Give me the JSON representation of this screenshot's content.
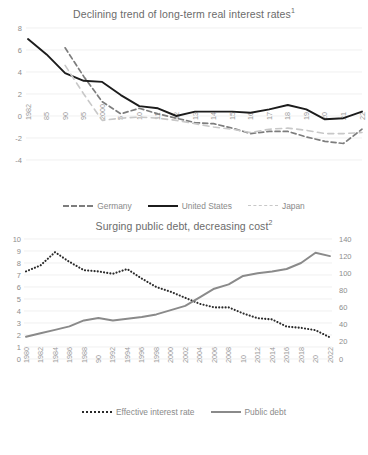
{
  "chart_data": [
    {
      "type": "line",
      "title": "Declining trend of long-term real interest rates",
      "title_superscript": "1",
      "xlabel": "",
      "ylabel": "",
      "ylim": [
        -4,
        8
      ],
      "yticks": [
        8,
        6,
        4,
        2,
        0,
        -2,
        -4
      ],
      "grid": true,
      "legend_position": "bottom",
      "x": [
        1982,
        1985,
        1990,
        1995,
        2000,
        2005,
        2010,
        2011,
        2012,
        2013,
        2014,
        2015,
        2016,
        2017,
        2018,
        2019,
        2020,
        2021,
        2022
      ],
      "tick_labels": [
        "1982",
        "85",
        "90",
        "95",
        "2000",
        "5",
        "10",
        "11",
        "12",
        "13",
        "14",
        "15",
        "16",
        "17",
        "18",
        "19",
        "20",
        "21",
        "22"
      ],
      "series": [
        {
          "name": "Germany",
          "style": "dashed-dark",
          "color": "#7d7d7d",
          "values": [
            null,
            null,
            6.2,
            3.6,
            1.3,
            0.2,
            0.7,
            0.2,
            -0.2,
            -0.6,
            -0.7,
            -1.1,
            -1.6,
            -1.4,
            -1.4,
            -1.9,
            -2.3,
            -2.5,
            -1.2
          ]
        },
        {
          "name": "United States",
          "style": "solid-black",
          "color": "#1c1c1c",
          "values": [
            7.0,
            5.6,
            3.9,
            3.2,
            3.1,
            1.9,
            0.9,
            0.7,
            0.0,
            0.4,
            0.4,
            0.4,
            0.3,
            0.6,
            1.0,
            0.6,
            -0.3,
            -0.2,
            0.4
          ]
        },
        {
          "name": "Japan",
          "style": "dashed-light",
          "color": "#c8c8c8",
          "values": [
            null,
            null,
            4.6,
            2.0,
            -0.4,
            -0.2,
            -0.1,
            -0.2,
            -0.4,
            -0.7,
            -1.0,
            -1.2,
            -1.5,
            -1.2,
            -1.1,
            -1.3,
            -1.6,
            -1.6,
            -1.5
          ]
        }
      ]
    },
    {
      "type": "line",
      "title": "Surging public debt, decreasing cost",
      "title_superscript": "2",
      "xlabel": "",
      "ylabel": "",
      "ylim": [
        0,
        10
      ],
      "yticks": [
        10,
        9,
        8,
        7,
        6,
        5,
        4,
        3,
        2,
        1,
        0
      ],
      "ylim_right": [
        0,
        140
      ],
      "yticks_right": [
        140,
        120,
        100,
        80,
        60,
        40,
        20,
        0
      ],
      "grid": true,
      "legend_position": "bottom",
      "x": [
        1980,
        1982,
        1984,
        1986,
        1988,
        1990,
        1992,
        1994,
        1996,
        1998,
        2000,
        2002,
        2004,
        2006,
        2008,
        2010,
        2012,
        2014,
        2016,
        2018,
        2020,
        2022
      ],
      "tick_labels": [
        "1980",
        "1982",
        "1984",
        "1986",
        "1988",
        "90",
        "1992",
        "1994",
        "1996",
        "1998",
        "2000",
        "2002",
        "2004",
        "2006",
        "2008",
        "10",
        "2012",
        "2014",
        "2016",
        "2018",
        "20",
        "2022"
      ],
      "series": [
        {
          "name": "Effective interest rate",
          "axis": "left",
          "style": "dotted-black",
          "color": "#2a2a2a",
          "values": [
            7.3,
            7.8,
            8.9,
            8.1,
            7.4,
            7.3,
            7.1,
            7.5,
            6.7,
            6.0,
            5.6,
            5.1,
            4.6,
            4.3,
            4.3,
            3.8,
            3.4,
            3.3,
            2.7,
            2.6,
            2.4,
            1.8
          ]
        },
        {
          "name": "Public debt",
          "axis": "right",
          "style": "solid-gray",
          "color": "#8a8a8a",
          "values": [
            26,
            30,
            34,
            38,
            45,
            48,
            45,
            47,
            49,
            52,
            57,
            62,
            72,
            82,
            87,
            97,
            100,
            102,
            105,
            112,
            124,
            120
          ]
        }
      ]
    }
  ],
  "chart1": {
    "title": "Declining trend of long-term real interest rates",
    "title_superscript": "1",
    "legend": [
      {
        "label": "Germany",
        "style": "sw-dash-dark"
      },
      {
        "label": "United States",
        "style": "sw-solid-black"
      },
      {
        "label": "Japan",
        "style": "sw-dash-light"
      }
    ]
  },
  "chart2": {
    "title": "Surging public debt, decreasing cost",
    "title_superscript": "2",
    "legend": [
      {
        "label": "Effective interest rate",
        "style": "sw-dot-black"
      },
      {
        "label": "Public debt",
        "style": "sw-solid-gray"
      }
    ]
  }
}
